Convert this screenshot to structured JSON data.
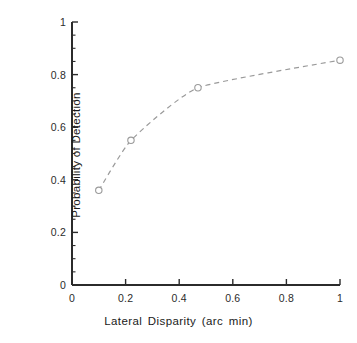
{
  "chart_data": {
    "type": "line",
    "title": "",
    "xlabel": "Lateral Disparity (arc min)",
    "ylabel": "Probability of Detection",
    "xlim": [
      0,
      1
    ],
    "ylim": [
      0,
      1
    ],
    "grid": false,
    "legend": null,
    "marker": "open-circle",
    "linestyle": "dashed",
    "line_color": "#9a9a9a",
    "marker_color": "#9a9a9a",
    "axis_color": "#2b2b2b",
    "x": [
      0.1,
      0.22,
      0.47,
      1.0
    ],
    "y": [
      0.36,
      0.55,
      0.75,
      0.855
    ],
    "points": [
      {
        "x": 0.1,
        "y": 0.36
      },
      {
        "x": 0.22,
        "y": 0.55
      },
      {
        "x": 0.47,
        "y": 0.75
      },
      {
        "x": 1.0,
        "y": 0.855
      }
    ],
    "series": [
      {
        "name": "Probability of Detection",
        "values": [
          0.36,
          0.55,
          0.75,
          0.855
        ]
      }
    ],
    "xticks": [
      {
        "value": 0,
        "label": "0"
      },
      {
        "value": 0.2,
        "label": "0.2"
      },
      {
        "value": 0.4,
        "label": "0.4"
      },
      {
        "value": 0.6,
        "label": "0.6"
      },
      {
        "value": 0.8,
        "label": "0.8"
      },
      {
        "value": 1,
        "label": "1"
      }
    ],
    "yticks": [
      {
        "value": 0,
        "label": "0"
      },
      {
        "value": 0.2,
        "label": "0.2"
      },
      {
        "value": 0.4,
        "label": "0.4"
      },
      {
        "value": 0.6,
        "label": "0.6"
      },
      {
        "value": 0.8,
        "label": "0.8"
      },
      {
        "value": 1,
        "label": "1"
      }
    ],
    "x_minor_tick_step": 0.05,
    "y_minor_tick_step": 0.05
  }
}
